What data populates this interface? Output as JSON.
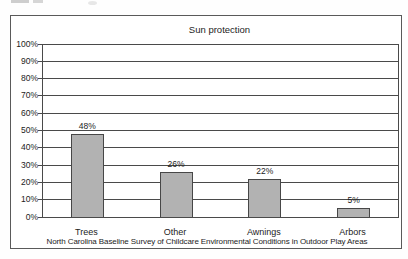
{
  "chart_data": {
    "type": "bar",
    "title": "Sun protection",
    "categories": [
      "Trees",
      "Other",
      "Awnings",
      "Arbors"
    ],
    "values": [
      48,
      26,
      22,
      5
    ],
    "value_labels": [
      "48%",
      "26%",
      "22%",
      "5%"
    ],
    "y_ticks": [
      "0%",
      "10%",
      "20%",
      "30%",
      "40%",
      "50%",
      "60%",
      "70%",
      "80%",
      "90%",
      "100%"
    ],
    "ylim": [
      0,
      100
    ],
    "grid": "horizontal",
    "legend": "none",
    "xlabel": "",
    "ylabel": "",
    "caption": "North Carolina Baseline Survey of Childcare Environmental Conditions in Outdoor Play Areas",
    "colors": {
      "bar_fill": "#b2b2b2",
      "bar_border": "#474747",
      "gridline": "#4a4a4a",
      "axis": "#4a4a4a",
      "frame_border": "#5a5a5a",
      "text": "#1c1c1c",
      "background": "#ffffff"
    }
  }
}
